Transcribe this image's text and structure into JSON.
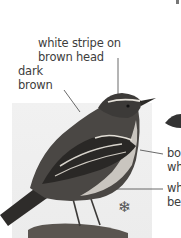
{
  "labels": {
    "head_stripe": [
      "white stripe on",
      "brown head"
    ],
    "back": [
      "dark",
      "brown"
    ],
    "wing": [
      "bo",
      "wh"
    ],
    "belly": [
      "wh",
      "be"
    ]
  },
  "icons": {
    "winter_symbol": "❄"
  }
}
